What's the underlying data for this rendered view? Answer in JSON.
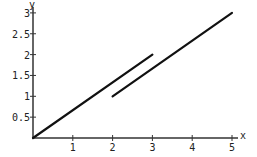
{
  "chart_data": {
    "type": "line",
    "title": "",
    "xlabel": "x",
    "ylabel": "y",
    "xlim": [
      0,
      5
    ],
    "ylim": [
      0,
      3
    ],
    "grid": false,
    "legend": null,
    "x_ticks": [
      1,
      2,
      3,
      4,
      5
    ],
    "x_tick_labels": [
      "1",
      "2",
      "3",
      "4",
      "5"
    ],
    "y_ticks": [
      0.5,
      1,
      1.5,
      2,
      2.5,
      3
    ],
    "y_tick_labels": [
      "0.5",
      "1",
      "1.5",
      "2",
      "2.5",
      "3"
    ],
    "series": [
      {
        "name": "segment-1",
        "x": [
          0,
          3
        ],
        "y": [
          0,
          2
        ],
        "color": "#111111"
      },
      {
        "name": "segment-2",
        "x": [
          2,
          5
        ],
        "y": [
          1,
          3
        ],
        "color": "#111111"
      }
    ]
  },
  "layout": {
    "origin_px": [
      33,
      138
    ],
    "x_unit_px": 39.8,
    "y_unit_px": 41.7,
    "axis_color": "#333333"
  }
}
